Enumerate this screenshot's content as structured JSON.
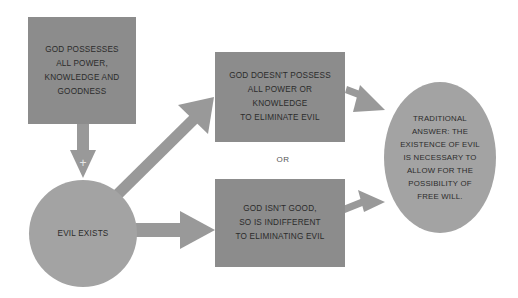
{
  "diagram": {
    "nodes": {
      "premise": {
        "text": "GOD POSSESSES\nALL POWER,\nKNOWLEDGE AND\nGOODNESS",
        "shape": "rect",
        "color": "#8c8c8c"
      },
      "evil": {
        "text": "EVIL EXISTS",
        "shape": "circle",
        "color": "#a3a3a3"
      },
      "option_power": {
        "text": "GOD DOESN'T POSSESS\nALL POWER OR\nKNOWLEDGE\nTO ELIMINATE EVIL",
        "shape": "rect",
        "color": "#8c8c8c"
      },
      "option_good": {
        "text": "GOD ISN'T GOOD,\nSO IS INDIFFERENT\nTO ELIMINATING EVIL",
        "shape": "rect",
        "color": "#8c8c8c"
      },
      "answer": {
        "text": "TRADITIONAL\nANSWER: THE\nEXISTENCE OF EVIL\nIS NECESSARY TO\nALLOW FOR THE\nPOSSIBILITY OF\nFREE WILL.",
        "shape": "ellipse",
        "color": "#a3a3a3"
      }
    },
    "connector_label": "OR",
    "plus_symbol": "+",
    "arrow_color": "#999999",
    "edges": [
      {
        "from": "premise",
        "to": "evil",
        "label": "+"
      },
      {
        "from": "evil",
        "to": "option_power"
      },
      {
        "from": "evil",
        "to": "option_good"
      },
      {
        "from": "option_power",
        "to": "answer"
      },
      {
        "from": "option_good",
        "to": "answer"
      }
    ]
  }
}
